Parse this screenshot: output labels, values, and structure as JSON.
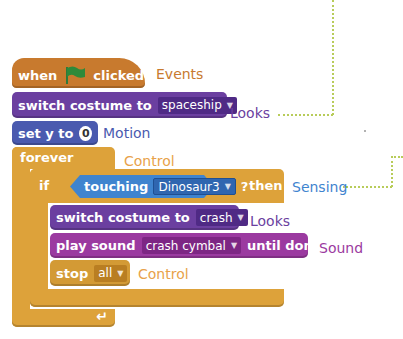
{
  "script": {
    "hat": {
      "when": "when",
      "flag_icon": "green-flag-icon",
      "clicked": "clicked",
      "category_label": "Events"
    },
    "switch_costume_1": {
      "text": "switch costume to",
      "value": "spaceship",
      "category_label": "Looks"
    },
    "set_y": {
      "text": "set y to",
      "value": "0",
      "category_label": "Motion"
    },
    "forever": {
      "text": "forever",
      "category_label": "Control"
    },
    "if_block": {
      "if": "if",
      "then": "then"
    },
    "touching": {
      "text": "touching",
      "value": "Dinosaur3",
      "question": "?",
      "category_label": "Sensing"
    },
    "switch_costume_2": {
      "text": "switch costume to",
      "value": "crash",
      "category_label": "Looks"
    },
    "play_sound": {
      "text": "play sound",
      "value": "crash cymbal",
      "suffix": "until done",
      "category_label": "Sound"
    },
    "stop": {
      "text": "stop",
      "value": "all",
      "category_label": "Control"
    },
    "loop_arrow": "↵"
  },
  "colors": {
    "events": "#c87a2e",
    "looks": "#6b3fa0",
    "motion": "#4a5aaf",
    "control": "#dda23a",
    "sensing": "#3f84cf",
    "sound": "#9b3aa0",
    "callout_line": "#b8cc5a"
  },
  "dropdown_arrow": "▼"
}
